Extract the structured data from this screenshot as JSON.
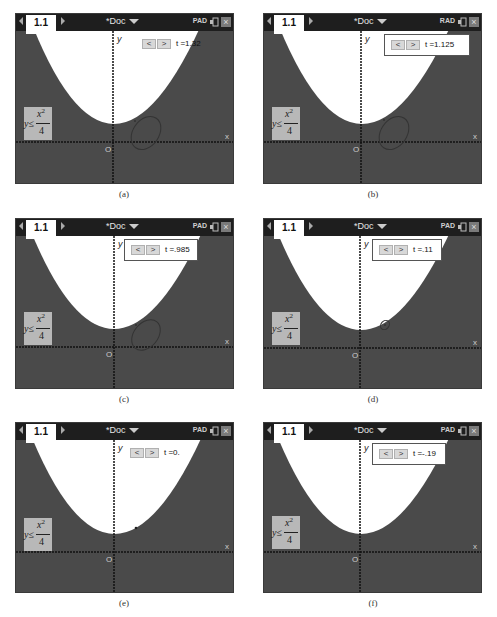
{
  "figure": {
    "panels": [
      {
        "id": "a",
        "caption": "(a)",
        "tab": "1.1",
        "doc_title": "*Doc",
        "mode": "PAD",
        "slider": {
          "prev": "<",
          "next": ">",
          "value_label": "t =1.32",
          "bordered": false
        },
        "inequality": {
          "lhs": "y≤",
          "numerator": "x",
          "exponent": "2",
          "denominator": "4"
        },
        "axis_labels": {
          "y": "y",
          "x": "x",
          "origin": "O"
        },
        "ellipse": {
          "cx": 130,
          "cy": 119,
          "rx": 18,
          "ry": 13,
          "rotation": -55,
          "visible": true
        }
      },
      {
        "id": "b",
        "caption": "(b)",
        "tab": "1.1",
        "doc_title": "*Doc",
        "mode": "RAD",
        "slider": {
          "prev": "<",
          "next": ">",
          "value_label": "t =1.125",
          "bordered": true
        },
        "inequality": {
          "lhs": "y≤",
          "numerator": "x",
          "exponent": "2",
          "denominator": "4"
        },
        "axis_labels": {
          "y": "y",
          "x": "x",
          "origin": "O"
        },
        "ellipse": {
          "cx": 130,
          "cy": 119,
          "rx": 18,
          "ry": 13,
          "rotation": -55,
          "visible": true
        }
      },
      {
        "id": "c",
        "caption": "(c)",
        "tab": "1.1",
        "doc_title": "*Doc",
        "mode": "PAD",
        "slider": {
          "prev": "<",
          "next": ">",
          "value_label": "t =.985",
          "bordered": true
        },
        "inequality": {
          "lhs": "y≤",
          "numerator": "x",
          "exponent": "2",
          "denominator": "4"
        },
        "axis_labels": {
          "y": "y",
          "x": "x",
          "origin": "O"
        },
        "ellipse": {
          "cx": 130,
          "cy": 119,
          "rx": 17,
          "ry": 12,
          "rotation": -50,
          "visible": true
        }
      },
      {
        "id": "d",
        "caption": "(d)",
        "tab": "1.1",
        "doc_title": "*Doc",
        "mode": "PAD",
        "slider": {
          "prev": "<",
          "next": ">",
          "value_label": "t =.11",
          "bordered": true
        },
        "inequality": {
          "lhs": "y≤",
          "numerator": "x",
          "exponent": "2",
          "denominator": "4"
        },
        "axis_labels": {
          "y": "y",
          "x": "x",
          "origin": "O"
        },
        "ellipse": {
          "cx": 129,
          "cy": 119,
          "rx": 5,
          "ry": 4,
          "rotation": -50,
          "visible": true
        }
      },
      {
        "id": "e",
        "caption": "(e)",
        "tab": "1.1",
        "doc_title": "*Doc",
        "mode": "PAD",
        "slider": {
          "prev": "<",
          "next": ">",
          "value_label": "t =0.",
          "bordered": false
        },
        "inequality": {
          "lhs": "y≤",
          "numerator": "x",
          "exponent": "2",
          "denominator": "4"
        },
        "axis_labels": {
          "y": "y",
          "x": "x",
          "origin": "O"
        },
        "ellipse": {
          "cx": 130,
          "cy": 119,
          "rx": 0,
          "ry": 0,
          "rotation": 0,
          "visible": false
        }
      },
      {
        "id": "f",
        "caption": "(f)",
        "tab": "1.1",
        "doc_title": "*Doc",
        "mode": "PAD",
        "slider": {
          "prev": "<",
          "next": ">",
          "value_label": "t =-.19",
          "bordered": true
        },
        "inequality": {
          "lhs": "y≤",
          "numerator": "x",
          "exponent": "2",
          "denominator": "4"
        },
        "axis_labels": {
          "y": "y",
          "x": "x",
          "origin": "O"
        },
        "ellipse": {
          "cx": 130,
          "cy": 119,
          "rx": 0,
          "ry": 0,
          "rotation": 0,
          "visible": false
        }
      }
    ],
    "colors": {
      "background_shade": "#4a4a4a",
      "parabola_interior": "#ffffff",
      "topbar": "#1e1e1e",
      "inequality_box": "#b8b8b8"
    }
  }
}
